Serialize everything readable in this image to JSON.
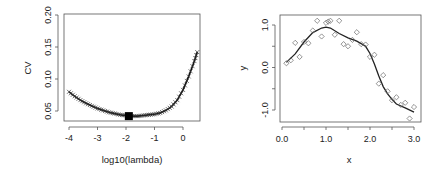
{
  "chart_data": [
    {
      "type": "line",
      "title": "",
      "xlabel": "log10(lambda)",
      "ylabel": "CV",
      "xlim": [
        -4.2,
        0.6
      ],
      "ylim": [
        0.035,
        0.205
      ],
      "xticks": [
        "-4",
        "-3",
        "-2",
        "-1",
        "0"
      ],
      "yticks": [
        "0.05",
        "0.10",
        "0.15",
        "0.20"
      ],
      "grid": false,
      "marker": "x",
      "minimum": {
        "x": -1.9,
        "y": 0.042,
        "marker": "filled-square"
      },
      "x": [
        -4.0,
        -3.8,
        -3.6,
        -3.4,
        -3.2,
        -3.0,
        -2.8,
        -2.6,
        -2.4,
        -2.2,
        -2.0,
        -1.8,
        -1.6,
        -1.4,
        -1.2,
        -1.0,
        -0.8,
        -0.6,
        -0.4,
        -0.2,
        0.0,
        0.2,
        0.4,
        0.5
      ],
      "values": [
        0.08,
        0.073,
        0.067,
        0.062,
        0.058,
        0.054,
        0.051,
        0.048,
        0.046,
        0.044,
        0.043,
        0.042,
        0.042,
        0.043,
        0.044,
        0.045,
        0.047,
        0.051,
        0.057,
        0.067,
        0.083,
        0.104,
        0.128,
        0.142
      ]
    },
    {
      "type": "scatter",
      "title": "",
      "xlabel": "x",
      "ylabel": "y",
      "xlim": [
        -0.05,
        3.1
      ],
      "ylim": [
        -1.25,
        1.2
      ],
      "xticks": [
        "0.0",
        "1.0",
        "2.0",
        "3.0"
      ],
      "yticks": [
        "-1.0",
        "0.0",
        "1.0"
      ],
      "grid": false,
      "series": [
        {
          "name": "observations",
          "marker": "open-diamond",
          "x": [
            0.1,
            0.2,
            0.3,
            0.4,
            0.5,
            0.6,
            0.7,
            0.8,
            0.9,
            1.0,
            1.05,
            1.1,
            1.2,
            1.3,
            1.4,
            1.5,
            1.6,
            1.7,
            1.8,
            1.9,
            2.0,
            2.1,
            2.2,
            2.3,
            2.4,
            2.5,
            2.6,
            2.7,
            2.8,
            2.9,
            3.0
          ],
          "y": [
            0.1,
            0.17,
            0.58,
            0.25,
            0.6,
            0.57,
            0.87,
            1.1,
            0.73,
            1.05,
            1.08,
            1.1,
            0.77,
            1.1,
            0.55,
            0.5,
            0.65,
            0.83,
            0.55,
            0.54,
            0.25,
            0.3,
            -0.38,
            -0.18,
            -0.56,
            -0.77,
            -0.7,
            -0.88,
            -0.83,
            -1.2,
            -0.93
          ]
        },
        {
          "name": "smooth fit",
          "type": "line",
          "x": [
            0.1,
            0.3,
            0.5,
            0.7,
            0.9,
            1.0,
            1.1,
            1.3,
            1.5,
            1.7,
            1.9,
            2.0,
            2.1,
            2.2,
            2.3,
            2.4,
            2.5,
            2.6,
            2.8,
            3.0
          ],
          "y": [
            0.12,
            0.32,
            0.6,
            0.82,
            0.93,
            0.95,
            0.93,
            0.8,
            0.7,
            0.62,
            0.5,
            0.33,
            0.08,
            -0.2,
            -0.45,
            -0.62,
            -0.75,
            -0.86,
            -0.95,
            -1.05
          ]
        }
      ]
    }
  ]
}
